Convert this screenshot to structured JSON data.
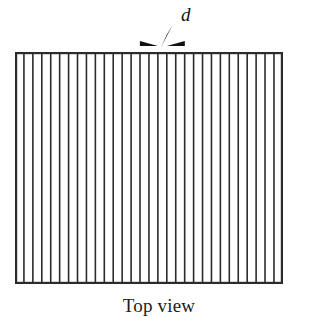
{
  "figure": {
    "caption": "Top view",
    "dimension_label": "d",
    "colors": {
      "line": "#2b2b2b",
      "background": "#ffffff",
      "text": "#1c1c1c"
    },
    "panel": {
      "x": 15,
      "y": 52,
      "width": 268,
      "height": 232,
      "border_width": 2.2
    },
    "slits": {
      "count": 30,
      "spacing": 8.93,
      "line_width": 1.6,
      "description": "evenly spaced vertical lines spanning the panel height"
    },
    "annotation": {
      "type": "dimension-arrows",
      "gap_index": 16,
      "arrow_y": 46,
      "left_arrow": {
        "tail_x": 150,
        "tip_x": 168
      },
      "right_arrow": {
        "tail_x": 196,
        "tip_x": 178
      },
      "leader_line": {
        "from_x": 173,
        "from_y": 47,
        "to_x": 184,
        "to_y": 24
      }
    }
  }
}
